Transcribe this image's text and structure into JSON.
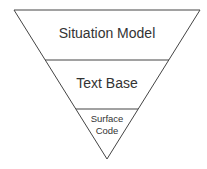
{
  "diagram": {
    "type": "inverted-pyramid",
    "levels": [
      {
        "label": "Situation Model"
      },
      {
        "label": "Text Base"
      },
      {
        "label_line1": "Surface",
        "label_line2": "Code"
      }
    ],
    "colors": {
      "stroke": "#444444",
      "text": "#333333",
      "background": "#ffffff"
    }
  }
}
